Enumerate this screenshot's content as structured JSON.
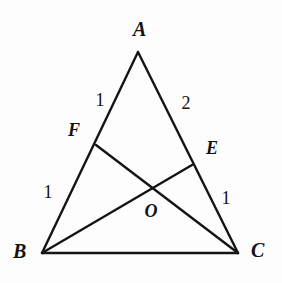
{
  "figure": {
    "background_color": "#fdfdfd",
    "stroke_color": "#141414",
    "stroke_width": 2.4
  },
  "vertices": {
    "A": {
      "label": "A",
      "x": 138,
      "y": 52,
      "label_x": 140,
      "label_y": 29
    },
    "B": {
      "label": "B",
      "x": 42,
      "y": 253,
      "label_x": 20,
      "label_y": 251
    },
    "C": {
      "label": "C",
      "x": 238,
      "y": 253,
      "label_x": 258,
      "label_y": 250
    }
  },
  "points": {
    "F": {
      "label": "F",
      "x": 96,
      "y": 145,
      "label_x": 74,
      "label_y": 130
    },
    "E": {
      "label": "E",
      "x": 192,
      "y": 165,
      "label_x": 212,
      "label_y": 148
    },
    "O": {
      "label": "O",
      "x": 150,
      "y": 190,
      "label_x": 151,
      "label_y": 211
    }
  },
  "segment_labels": [
    {
      "name": "af-length",
      "text": "1",
      "x": 100,
      "y": 100
    },
    {
      "name": "ae-length",
      "text": "2",
      "x": 186,
      "y": 103
    },
    {
      "name": "fb-length",
      "text": "1",
      "x": 48,
      "y": 192
    },
    {
      "name": "ec-length",
      "text": "1",
      "x": 226,
      "y": 198
    }
  ],
  "edges": [
    {
      "name": "side-ab",
      "from": "A",
      "to": "B"
    },
    {
      "name": "side-ac",
      "from": "A",
      "to": "C"
    },
    {
      "name": "side-bc",
      "from": "B",
      "to": "C"
    },
    {
      "name": "cevian-fc",
      "from": "F",
      "to": "C"
    },
    {
      "name": "cevian-be",
      "from": "B",
      "to": "E"
    }
  ]
}
